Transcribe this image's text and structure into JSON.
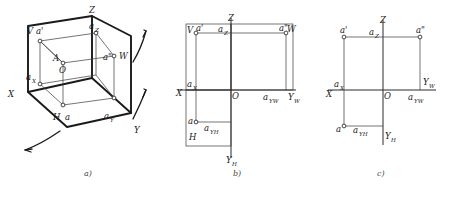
{
  "figure": {
    "background_color": "#ffffff",
    "line_color": "#1a1a1a",
    "captions": [
      {
        "id": "a",
        "text": "a)"
      },
      {
        "id": "b",
        "text": "b)"
      },
      {
        "id": "c",
        "text": "c)"
      }
    ]
  },
  "panel_a": {
    "caption": "a)",
    "description": "Pictorial view of the three mutually perpendicular projection planes with point A and its projections",
    "axis_labels": {
      "x": "X",
      "y": "Y",
      "z": "Z"
    },
    "plane_labels": {
      "v": "V",
      "h": "H",
      "w": "W"
    },
    "point_labels": {
      "space_point": "A",
      "origin": "O",
      "front_projection": "a'",
      "top_projection": "a",
      "side_projection": "a\"",
      "x_foot": "a",
      "x_foot_sub": "X",
      "y_foot": "a",
      "y_foot_sub": "Y",
      "z_foot": "a",
      "z_foot_sub": "Z"
    },
    "rotation_arrows": 3
  },
  "panel_b": {
    "caption": "b)",
    "description": "Unfolded projection planes still showing plane outlines V, H and W",
    "axis_labels": {
      "x": "X",
      "z": "Z",
      "y_h": "Y",
      "y_h_sub": "H",
      "y_w": "Y",
      "y_w_sub": "W"
    },
    "plane_labels": {
      "v": "V",
      "h": "H",
      "w": "W"
    },
    "point_labels": {
      "origin": "O",
      "front_projection": "a'",
      "top_projection": "a",
      "side_projection": "a\"",
      "x_foot": "a",
      "x_foot_sub": "X",
      "z_foot": "a",
      "z_foot_sub": "Z",
      "y_h_foot": "a",
      "y_h_foot_sub": "YH",
      "y_w_foot": "a",
      "y_w_foot_sub": "YW"
    }
  },
  "panel_c": {
    "caption": "c)",
    "description": "Final two-dimensional projection drawing with plane outlines removed",
    "axis_labels": {
      "x": "X",
      "z": "Z",
      "y_h": "Y",
      "y_h_sub": "H",
      "y_w": "Y",
      "y_w_sub": "W"
    },
    "point_labels": {
      "origin": "O",
      "front_projection": "a'",
      "top_projection": "a",
      "side_projection": "a\"",
      "x_foot": "a",
      "x_foot_sub": "X",
      "z_foot": "a",
      "z_foot_sub": "Z",
      "y_h_foot": "a",
      "y_h_foot_sub": "YH",
      "y_w_foot": "a",
      "y_w_foot_sub": "YW"
    }
  }
}
